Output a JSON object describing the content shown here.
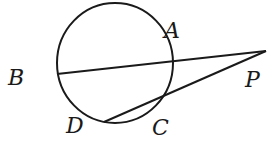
{
  "diagram": {
    "type": "geometry",
    "circle": {
      "cx": 115,
      "cy": 63,
      "rx": 58,
      "ry": 60
    },
    "points": {
      "A": {
        "label": "A",
        "x": 170,
        "y": 33
      },
      "B": {
        "label": "B",
        "x": 57,
        "y": 74
      },
      "P": {
        "label": "P",
        "x": 266,
        "y": 51
      },
      "C": {
        "label": "C",
        "x": 162,
        "y": 98
      },
      "D": {
        "label": "D",
        "x": 104,
        "y": 122
      }
    },
    "labels": {
      "A": "A",
      "B": "B",
      "P": "P",
      "C": "C",
      "D": "D"
    },
    "segments": [
      {
        "from": "B",
        "to": "P"
      },
      {
        "from": "P",
        "to": "D"
      },
      {
        "from": "D",
        "to": "C",
        "curved": true
      }
    ],
    "stroke_color": "#1a1a1a"
  }
}
